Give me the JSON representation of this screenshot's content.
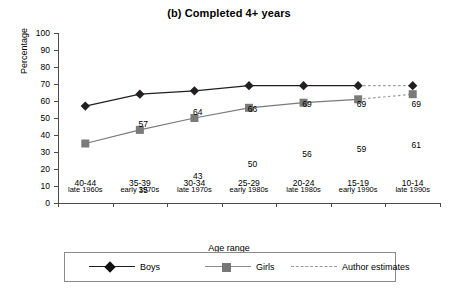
{
  "chart_data": {
    "type": "line",
    "title": "(b) Completed 4+ years",
    "xlabel": "Age range",
    "ylabel": "Percentage",
    "ylim": [
      0,
      100
    ],
    "yticks": [
      0,
      10,
      20,
      30,
      40,
      50,
      60,
      70,
      80,
      90,
      100
    ],
    "grid": false,
    "legend_position": "bottom",
    "categories": [
      "40-44",
      "35-39",
      "30-34",
      "25-29",
      "20-24",
      "15-19",
      "10-14"
    ],
    "period_labels": [
      "late 1960s",
      "early 1970s",
      "late 1970s",
      "early 1980s",
      "late 1980s",
      "early 1990s",
      "late 1990s"
    ],
    "series": [
      {
        "name": "Boys",
        "values": [
          57,
          64,
          66,
          69,
          69,
          69,
          69
        ],
        "color": "#231f20",
        "marker": "diamond",
        "estimated_from_index": 5
      },
      {
        "name": "Girls",
        "values": [
          35,
          43,
          50,
          56,
          59,
          61,
          64
        ],
        "color": "#7a7a7a",
        "marker": "square",
        "estimated_from_index": 5
      }
    ],
    "legend": [
      {
        "label": "Boys",
        "marker": "diamond",
        "style": "solid-dark"
      },
      {
        "label": "Girls",
        "marker": "square",
        "style": "solid-gray"
      },
      {
        "label": "Author estimates",
        "marker": "none",
        "style": "dashed"
      }
    ],
    "annotations": {
      "note": "Final segment of both series drawn dashed to indicate author estimates"
    }
  },
  "colors": {
    "boys": "#231f20",
    "girls": "#7a7a7a",
    "estimate": "#9a9a9a",
    "axis": "#4a4a4a",
    "background": "#ffffff"
  }
}
